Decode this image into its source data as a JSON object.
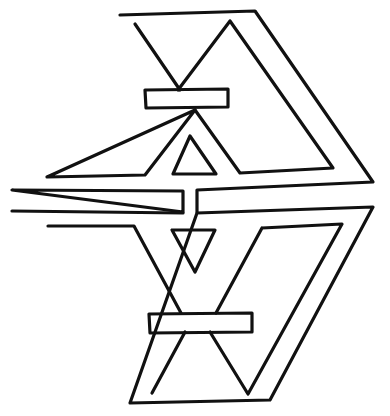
{
  "figure": {
    "stroke_color": "#111111",
    "background_color": "#ffffff",
    "width": 390,
    "height": 416
  },
  "shapes": {
    "upper_outer": "M120,15 L255,11 L373,182 L197,190 L197,212 M183,212 L183,191 L12,190 Z",
    "upper_left_triangle": "M135,24 L180,90 M195,110 L145,175 L47,177 Z",
    "upper_right_triangle": "M230,21 L333,168 L240,173 L195,110 M178,90 L230,21",
    "upper_bar": "M145,90 L228,89 L228,107 L146,108 Z",
    "upper_small_triangle": "M190,136 L216,174 L173,174 Z",
    "lower_outer": "M12,211 L183,213 M197,213 L373,207 L270,400 L130,403 Z",
    "lower_left_triangle": "M48,226 L134,226 L181,313 M185,332 L152,393 Z",
    "lower_right_triangle": "M262,228 L342,224 L248,394 L210,332 M216,313 L262,228",
    "lower_bar": "M149,314 L252,313 L252,332 L150,333 Z",
    "lower_small_triangle": "M172,230 L215,230 L195,272 Z"
  }
}
